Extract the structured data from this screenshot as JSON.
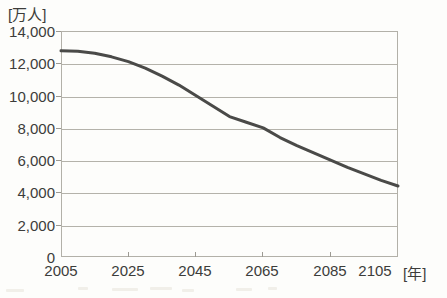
{
  "figure": {
    "background_color": "#fdfdfb",
    "frame_color": "#b2b0a8",
    "grid_color": "#b4b2aa",
    "curve_color": "#4a4a48",
    "text_color": "#3c3c3a"
  },
  "axes": {
    "y_unit_label": "[万人]",
    "x_unit_label": "[年]",
    "y_ticks": [
      "14,000",
      "12,000",
      "10,000",
      "8,000",
      "6,000",
      "4,000",
      "2,000",
      "0"
    ],
    "x_ticks": [
      "2005",
      "2025",
      "2045",
      "2065",
      "2085",
      "2105"
    ]
  },
  "chart_data": {
    "type": "line",
    "title": "",
    "xlabel": "[年]",
    "ylabel": "[万人]",
    "xlim": [
      2005,
      2105
    ],
    "ylim": [
      0,
      14000
    ],
    "grid": true,
    "legend_position": "none",
    "xtick_values": [
      2005,
      2025,
      2045,
      2065,
      2085,
      2105
    ],
    "xtick_labels": [
      "2005",
      "2025",
      "2045",
      "2065",
      "2085",
      "2105"
    ],
    "ytick_values": [
      0,
      2000,
      4000,
      6000,
      8000,
      10000,
      12000,
      14000
    ],
    "ytick_labels": [
      "0",
      "2,000",
      "4,000",
      "6,000",
      "8,000",
      "10,000",
      "12,000",
      "14,000"
    ],
    "series": [
      {
        "name": "総人口",
        "color": "#4a4a48",
        "linewidth": 3,
        "x": [
          2005,
          2010,
          2015,
          2020,
          2025,
          2030,
          2035,
          2040,
          2045,
          2050,
          2055,
          2060,
          2065,
          2070,
          2075,
          2080,
          2085,
          2090,
          2095,
          2100,
          2105
        ],
        "values": [
          12780,
          12740,
          12620,
          12400,
          12100,
          11700,
          11200,
          10650,
          10000,
          9350,
          8700,
          8350,
          8000,
          7400,
          6900,
          6450,
          6000,
          5550,
          5150,
          4750,
          4400
        ]
      }
    ]
  }
}
